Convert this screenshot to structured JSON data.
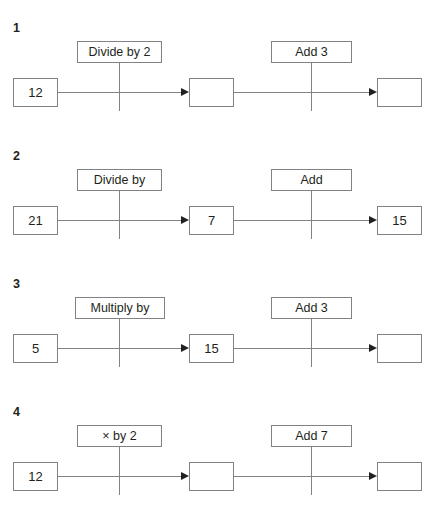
{
  "worksheet": {
    "type": "function-machine-chains",
    "problems": [
      {
        "number": "1",
        "start_value": "12",
        "operation_1": "Divide by 2",
        "middle_value": "",
        "operation_2": "Add 3",
        "end_value": ""
      },
      {
        "number": "2",
        "start_value": "21",
        "operation_1": "Divide by",
        "middle_value": "7",
        "operation_2": "Add",
        "end_value": "15"
      },
      {
        "number": "3",
        "start_value": "5",
        "operation_1": "Multiply by",
        "middle_value": "15",
        "operation_2": "Add 3",
        "end_value": ""
      },
      {
        "number": "4",
        "start_value": "12",
        "operation_1": "× by 2",
        "middle_value": "",
        "operation_2": "Add 7",
        "end_value": ""
      }
    ]
  },
  "colors": {
    "background": "#ffffff",
    "box_border": "#808285",
    "line": "#808285",
    "text": "#231f20",
    "arrow": "#231f20"
  }
}
